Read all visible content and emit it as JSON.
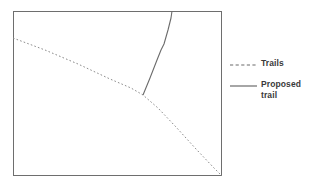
{
  "figure": {
    "frame_color": "#6e6e6e",
    "background_color": "#ffffff"
  },
  "map": {
    "frame": {
      "x": 13,
      "y": 11,
      "width": 209,
      "height": 165
    },
    "paths": [
      {
        "name": "trails-path",
        "style": "dashed",
        "color": "#8c8c8c",
        "dash_pattern": "1.6 2.2",
        "points": "13,38 45,50 78,64 110,79 131,88 143,95 158,108 176,127 196,149 214,168 222,176"
      },
      {
        "name": "proposed-trail-path",
        "style": "solid",
        "color": "#6b6b6b",
        "points": "143,95 150,78 157,60 161,50 164,44 168,30 171,18 172,11"
      }
    ]
  },
  "legend": {
    "entries": [
      {
        "icon": "dashed-line-icon",
        "label": "Trails",
        "style": "dashed",
        "color": "#6b6b6b"
      },
      {
        "icon": "solid-line-icon",
        "label": "Proposed\ntrail",
        "style": "solid",
        "color": "#6b6b6b"
      }
    ]
  }
}
